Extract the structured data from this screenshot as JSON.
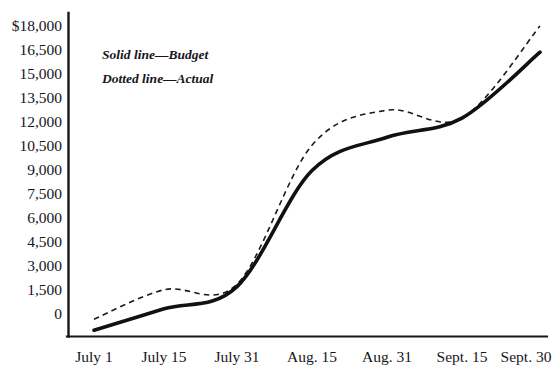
{
  "chart_data": {
    "type": "line",
    "title": "",
    "subtitle": "",
    "xlabel": "",
    "ylabel": "",
    "grid": false,
    "legend_position": "upper-left-inside",
    "categories": [
      "July 1",
      "July 15",
      "July 31",
      "Aug. 15",
      "Aug. 31",
      "Sept. 15",
      "Sept. 30"
    ],
    "x_tick_labels": [
      "July 1",
      "July 15",
      "July 31",
      "Aug. 15",
      "Aug. 31",
      "Sept. 15",
      "Sept. 30"
    ],
    "y_tick_labels": [
      "$18,000",
      "16,500",
      "15,000",
      "13,500",
      "12,000",
      "10,500",
      "9,000",
      "7,500",
      "6,000",
      "4,500",
      "3,000",
      "1,500",
      "0"
    ],
    "y_tick_values": [
      18000,
      16500,
      15000,
      13500,
      12000,
      10500,
      9000,
      7500,
      6000,
      4500,
      3000,
      1500,
      0
    ],
    "ylim": [
      -1500,
      18600
    ],
    "y_step": 1500,
    "series": [
      {
        "name": "Budget",
        "style": "solid",
        "color": "#111114",
        "values": [
          -1150,
          200,
          1600,
          8900,
          11000,
          12200,
          16350
        ]
      },
      {
        "name": "Actual",
        "style": "dotted",
        "color": "#1a1a1f",
        "values": [
          -450,
          1400,
          1750,
          10500,
          12700,
          12200,
          18000
        ]
      }
    ],
    "annotations": [
      "Solid line—Budget",
      "Dotted line—Actual"
    ]
  },
  "legend": {
    "budget_text": "Solid line—Budget",
    "actual_text": "Dotted line—Actual"
  },
  "axes": {
    "y_labels": {
      "t0": "$18,000",
      "t1": "16,500",
      "t2": "15,000",
      "t3": "13,500",
      "t4": "12,000",
      "t5": "10,500",
      "t6": "9,000",
      "t7": "7,500",
      "t8": "6,000",
      "t9": "4,500",
      "t10": "3,000",
      "t11": "1,500",
      "t12": "0"
    },
    "x_labels": {
      "t0": "July 1",
      "t1": "July 15",
      "t2": "July 31",
      "t3": "Aug. 15",
      "t4": "Aug. 31",
      "t5": "Sept. 15",
      "t6": "Sept. 30"
    }
  },
  "colors": {
    "ink": "#16161a",
    "background": "#ffffff"
  }
}
